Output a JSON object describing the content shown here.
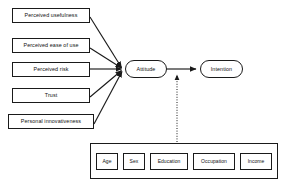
{
  "diagram": {
    "type": "path-diagram",
    "background_color": "#ffffff",
    "line_color": "#1a1a1a",
    "text_color": "#111111"
  },
  "antecedents": [
    {
      "id": "perceived-usefulness",
      "label": "Perceived usefulness",
      "x": 12,
      "y": 8,
      "w": 78,
      "h": 15
    },
    {
      "id": "perceived-ease-of-use",
      "label": "Perceived ease of use",
      "x": 12,
      "y": 38,
      "w": 78,
      "h": 15
    },
    {
      "id": "perceived-risk",
      "label": "Perceived risk",
      "x": 12,
      "y": 62,
      "w": 78,
      "h": 15
    },
    {
      "id": "trust",
      "label": "Trust",
      "x": 12,
      "y": 88,
      "w": 78,
      "h": 15
    },
    {
      "id": "personal-innovativeness",
      "label": "Personal innovativeness",
      "x": 8,
      "y": 114,
      "w": 86,
      "h": 15
    }
  ],
  "endogenous": [
    {
      "id": "attitude",
      "label": "Attitude",
      "x": 125,
      "y": 60,
      "w": 42,
      "h": 18
    },
    {
      "id": "intention",
      "label": "Intention",
      "x": 200,
      "y": 60,
      "w": 43,
      "h": 18
    }
  ],
  "moderator_group": {
    "id": "demographics",
    "x": 90,
    "y": 143,
    "w": 188,
    "h": 36,
    "items": [
      {
        "id": "age",
        "label": "Age",
        "w": 22
      },
      {
        "id": "sex",
        "label": "Sex",
        "w": 22
      },
      {
        "id": "education",
        "label": "Education",
        "w": 38
      },
      {
        "id": "occupation",
        "label": "Occupation",
        "w": 42
      },
      {
        "id": "income",
        "label": "Income",
        "w": 32
      }
    ]
  },
  "edges": [
    {
      "id": "pu-attitude",
      "from": "perceived-usefulness",
      "to": "attitude",
      "style": "solid"
    },
    {
      "id": "peou-attitude",
      "from": "perceived-ease-of-use",
      "to": "attitude",
      "style": "solid"
    },
    {
      "id": "pr-attitude",
      "from": "perceived-risk",
      "to": "attitude",
      "style": "solid"
    },
    {
      "id": "tr-attitude",
      "from": "trust",
      "to": "attitude",
      "style": "solid"
    },
    {
      "id": "pi-attitude",
      "from": "personal-innovativeness",
      "to": "attitude",
      "style": "solid"
    },
    {
      "id": "attitude-intention",
      "from": "attitude",
      "to": "intention",
      "style": "solid"
    },
    {
      "id": "demographics-moderation",
      "from": "demographics",
      "to": "attitude-intention",
      "style": "dotted"
    }
  ]
}
